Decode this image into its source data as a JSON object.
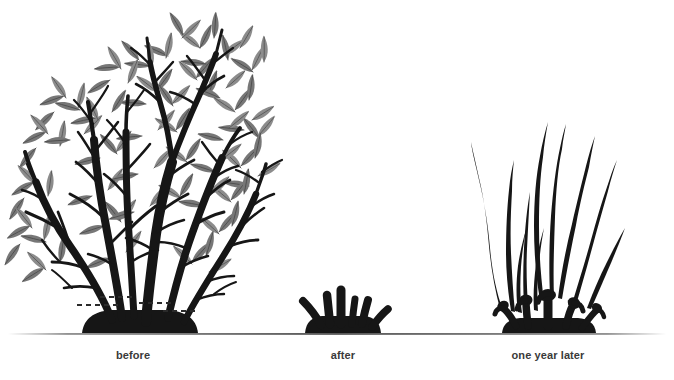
{
  "page": {
    "width": 674,
    "height": 380,
    "background_color": "#ffffff"
  },
  "palette": {
    "branch_color": "#161616",
    "leaf_fill": "#777777",
    "leaf_fill_light": "#8b8b8b",
    "leaf_vein": "#4f4f4f",
    "ground_line": "#4a4a4a",
    "caption_color": "#3a3a3a",
    "cut_line_color": "#2a2a2a"
  },
  "ground": {
    "y": 334,
    "x_start": 8,
    "x_end": 666
  },
  "captions": [
    {
      "id": "before",
      "label": "before",
      "center_x": 133,
      "y": 349
    },
    {
      "id": "after",
      "label": "after",
      "center_x": 343,
      "y": 349
    },
    {
      "id": "one-year-later",
      "label": "one year later",
      "center_x": 548,
      "y": 349
    }
  ],
  "panels": [
    {
      "id": "before",
      "caption": "before",
      "description": "Overgrown multi-stemmed shrub in full leaf with dashed cut lines marked near the base",
      "stem_count": 6,
      "height_px": 320,
      "has_leaves": true,
      "has_cut_marks": true
    },
    {
      "id": "after",
      "caption": "after",
      "description": "Shrub cut back hard to short stubs just above ground level",
      "stem_count": 5,
      "height_px": 45,
      "has_leaves": false,
      "has_cut_marks": false
    },
    {
      "id": "one-year-later",
      "caption": "one year later",
      "description": "Vigorous new whip-like shoots regrown from the pruned stump",
      "stem_count": 9,
      "height_px": 195,
      "has_leaves": false,
      "has_cut_marks": false
    }
  ],
  "cut_marks": [
    {
      "x1": 100,
      "x2": 133,
      "y": 297
    },
    {
      "x1": 77,
      "x2": 117,
      "y": 305
    },
    {
      "x1": 139,
      "x2": 172,
      "y": 303
    },
    {
      "x1": 163,
      "x2": 196,
      "y": 311
    }
  ]
}
